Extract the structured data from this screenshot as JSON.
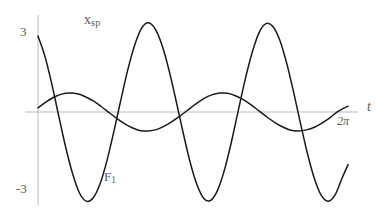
{
  "figure": {
    "kind": "line-plot",
    "background": "#ffffff",
    "curve_color": "#1a1a1a",
    "axis_color": "#b9b9c4",
    "label_color": "#5b5b5b"
  },
  "labels": {
    "y_top": "3",
    "y_bottom": "-3",
    "curve_small": {
      "base": "x",
      "sub": "sp"
    },
    "curve_large": {
      "base": "F",
      "sub": "1"
    },
    "x_axis": "t",
    "x_tick_2pi": "2π"
  },
  "chart_data": {
    "type": "line",
    "title": "",
    "xlabel": "t",
    "ylabel": "",
    "grid": false,
    "legend": "inline-annotations",
    "xlim": [
      0,
      6.2832
    ],
    "ylim": [
      -3.6,
      3.6
    ],
    "xticks": [
      {
        "value": 6.2832,
        "label": "2π"
      }
    ],
    "yticks": [
      {
        "value": 3,
        "label": "3"
      },
      {
        "value": -3,
        "label": "-3"
      }
    ],
    "series": [
      {
        "name": "F_1",
        "annotation": "F₁",
        "description": "large-amplitude fast oscillation, about three cycles across 0 to 2π",
        "form": "amplitude * cos(omega * t + phase)",
        "amplitude": 3.4,
        "omega": 3.06,
        "phase": 0.55,
        "color": "#1a1a1a",
        "x": [
          0.0,
          0.14,
          0.28,
          0.42,
          0.56,
          0.7,
          0.84,
          0.98,
          1.12,
          1.26,
          1.4,
          1.54,
          1.68,
          1.82,
          1.96,
          2.1,
          2.24,
          2.38,
          2.52,
          2.66,
          2.8,
          2.94,
          3.08,
          3.22,
          3.36,
          3.5,
          3.64,
          3.78,
          3.92,
          4.06,
          4.2,
          4.34,
          4.48,
          4.62,
          4.76,
          4.9,
          5.04,
          5.18,
          5.32,
          5.46,
          5.6,
          5.74,
          5.88,
          6.02,
          6.16,
          6.2832
        ],
        "y": [
          2.89,
          2.12,
          1.06,
          -0.15,
          -1.33,
          -2.34,
          -3.08,
          -3.39,
          -3.26,
          -2.72,
          -1.83,
          -0.72,
          0.47,
          1.61,
          2.55,
          3.19,
          3.39,
          3.14,
          2.5,
          1.55,
          0.41,
          -0.78,
          -1.89,
          -2.76,
          -3.29,
          -3.36,
          -2.97,
          -2.19,
          -1.13,
          0.07,
          1.25,
          2.26,
          3.02,
          3.36,
          3.25,
          2.73,
          1.85,
          0.75,
          -0.44,
          -1.58,
          -2.53,
          -3.17,
          -3.39,
          -3.15,
          -2.52,
          -2.0
        ]
      },
      {
        "name": "x_sp",
        "annotation": "xₛₚ",
        "description": "small-amplitude slow oscillation, about two cycles across 0 to 2π",
        "form": "amplitude * cos(omega * t + phase)",
        "amplitude": 0.72,
        "omega": 2.0,
        "phase": -1.35,
        "color": "#1a1a1a",
        "x": [
          0.0,
          0.16,
          0.32,
          0.48,
          0.64,
          0.8,
          0.96,
          1.12,
          1.28,
          1.44,
          1.6,
          1.76,
          1.92,
          2.08,
          2.24,
          2.4,
          2.56,
          2.72,
          2.88,
          3.04,
          3.2,
          3.36,
          3.52,
          3.68,
          3.84,
          4.0,
          4.16,
          4.32,
          4.48,
          4.64,
          4.8,
          4.96,
          5.12,
          5.28,
          5.44,
          5.6,
          5.76,
          5.92,
          6.08,
          6.2832
        ],
        "y": [
          0.16,
          0.38,
          0.56,
          0.68,
          0.72,
          0.69,
          0.58,
          0.42,
          0.21,
          -0.02,
          -0.25,
          -0.45,
          -0.61,
          -0.71,
          -0.72,
          -0.67,
          -0.54,
          -0.36,
          -0.15,
          0.08,
          0.31,
          0.51,
          0.65,
          0.72,
          0.71,
          0.62,
          0.47,
          0.27,
          0.04,
          -0.19,
          -0.4,
          -0.57,
          -0.69,
          -0.72,
          -0.68,
          -0.58,
          -0.41,
          -0.21,
          0.02,
          0.22
        ]
      }
    ],
    "axes": {
      "x_axis_y_value": 0,
      "y_axis_x_value": 0,
      "x_axis_pixel_span": [
        25,
        358
      ],
      "y_axis_pixel_span": [
        15,
        205
      ],
      "origin_pixel": [
        38,
        112
      ],
      "pixels_per_x_unit": 49.35,
      "pixels_per_y_unit": 26.3
    }
  }
}
